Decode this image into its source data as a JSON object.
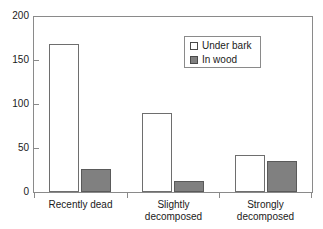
{
  "chart_data": {
    "type": "bar",
    "title": "",
    "subtitle": "",
    "xlabel": "",
    "ylabel": "",
    "categories": [
      "Recently dead",
      "Slightly\ndecomposed",
      "Strongly\ndecomposed"
    ],
    "series": [
      {
        "name": "Under bark",
        "color": "#ffffff",
        "values": [
          168,
          90,
          42
        ]
      },
      {
        "name": "In wood",
        "color": "#808080",
        "values": [
          26,
          12,
          35
        ]
      }
    ],
    "ylim": [
      0,
      200
    ],
    "yticks": [
      0,
      50,
      100,
      150,
      200
    ],
    "ytick_labels": [
      "0",
      "50",
      "100",
      "150",
      "200"
    ],
    "grid": false,
    "legend_position": "upper-center",
    "legend_entries": [
      "Under bark",
      "In wood"
    ]
  },
  "axes": {
    "y_labels": [
      "200",
      "150",
      "100",
      "50",
      "0"
    ]
  },
  "legend": {
    "items": [
      {
        "label": "Under bark",
        "swatch": "white-square-icon"
      },
      {
        "label": "In wood",
        "swatch": "gray-square-icon"
      }
    ]
  }
}
